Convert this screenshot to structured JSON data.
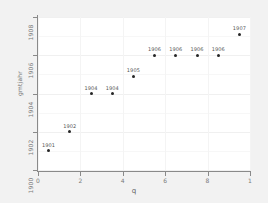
{
  "chart_data": {
    "type": "scatter",
    "title": "",
    "xlabel": "q",
    "ylabel": "gmtjahr",
    "xlim": [
      0,
      10
    ],
    "ylim": [
      1900,
      1908
    ],
    "grid": true,
    "legend": "none",
    "x_ticks": [
      {
        "value": 0,
        "label": "0"
      },
      {
        "value": 2,
        "label": "2"
      },
      {
        "value": 4,
        "label": "4"
      },
      {
        "value": 6,
        "label": "6"
      },
      {
        "value": 8,
        "label": "8"
      },
      {
        "value": 10,
        "label": "1"
      }
    ],
    "y_ticks": [
      {
        "value": 1900,
        "label": "1900"
      },
      {
        "value": 1902,
        "label": "1902"
      },
      {
        "value": 1904,
        "label": "1904"
      },
      {
        "value": 1906,
        "label": "1906"
      },
      {
        "value": 1908,
        "label": "1908"
      }
    ],
    "points": [
      {
        "x": 0.5,
        "y": 1901.0,
        "label": "1901"
      },
      {
        "x": 1.5,
        "y": 1902.0,
        "label": "1902"
      },
      {
        "x": 2.5,
        "y": 1904.0,
        "label": "1904"
      },
      {
        "x": 3.5,
        "y": 1904.0,
        "label": "1904"
      },
      {
        "x": 4.5,
        "y": 1904.9,
        "label": "1905"
      },
      {
        "x": 5.5,
        "y": 1906.0,
        "label": "1906"
      },
      {
        "x": 6.5,
        "y": 1906.0,
        "label": "1906"
      },
      {
        "x": 7.5,
        "y": 1906.0,
        "label": "1906"
      },
      {
        "x": 8.5,
        "y": 1906.0,
        "label": "1906"
      },
      {
        "x": 9.5,
        "y": 1907.1,
        "label": "1907"
      }
    ],
    "colors": {
      "point": "#262626",
      "panel_background": "#ffffff",
      "figure_background": "#f2f2f2",
      "gridline": "#f0f0f0",
      "axis": "#8a8a8a",
      "tick_text": "#7a7a7a",
      "axis_title": "#5f5f5f"
    }
  }
}
